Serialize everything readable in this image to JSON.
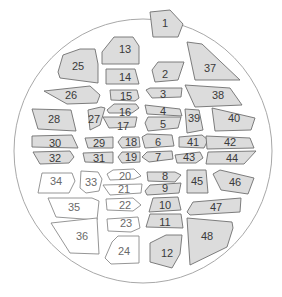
{
  "diagram": {
    "title": "",
    "colors": {
      "shaded_fill": "#dcdcdc",
      "unshaded_fill": "#ffffff",
      "stroke": "#6f6f6f",
      "outline": "#a8a8a8",
      "label": "#3a3a3a"
    },
    "outline": {
      "cx": 143,
      "cy": 151,
      "rx": 129,
      "ry": 132
    },
    "regions": [
      {
        "id": "1",
        "shaded": true,
        "points": "150,12 170,10 183,24 178,37 153,37",
        "lx": 165,
        "ly": 23
      },
      {
        "id": "2",
        "shaded": true,
        "points": "152,70 158,62 184,62 178,80 155,82",
        "lx": 165,
        "ly": 74
      },
      {
        "id": "3",
        "shaded": true,
        "points": "146,90 150,88 182,88 181,97 152,98",
        "lx": 163,
        "ly": 94
      },
      {
        "id": "4",
        "shaded": true,
        "points": "145,105 180,109 182,116 147,114",
        "lx": 163,
        "ly": 111
      },
      {
        "id": "5",
        "shaded": true,
        "points": "145,123 148,117 181,117 178,128 148,131",
        "lx": 163,
        "ly": 124
      },
      {
        "id": "6",
        "shaded": true,
        "points": "142,137 147,134 172,135 174,146 145,148",
        "lx": 158,
        "ly": 142
      },
      {
        "id": "7",
        "shaded": true,
        "points": "142,157 147,152 172,151 173,159 149,162",
        "lx": 158,
        "ly": 157
      },
      {
        "id": "8",
        "shaded": true,
        "points": "147,172 175,172 181,175 175,182 148,181",
        "lx": 165,
        "ly": 176
      },
      {
        "id": "9",
        "shaded": true,
        "points": "145,191 150,185 181,183 179,193 147,195",
        "lx": 165,
        "ly": 188
      },
      {
        "id": "10",
        "shaded": true,
        "points": "149,212 153,198 178,197 181,210",
        "lx": 165,
        "ly": 205
      },
      {
        "id": "11",
        "shaded": true,
        "points": "146,227 150,214 181,214 183,228",
        "lx": 165,
        "ly": 222
      },
      {
        "id": "12",
        "shaded": true,
        "points": "150,243 166,235 182,235 180,254 172,268 150,262",
        "lx": 167,
        "ly": 253
      },
      {
        "id": "13",
        "shaded": true,
        "points": "102,52 114,37 133,37 139,46 139,64 102,64",
        "lx": 125,
        "ly": 49
      },
      {
        "id": "14",
        "shaded": true,
        "points": "106,69 135,69 139,84 106,84",
        "lx": 125,
        "ly": 77
      },
      {
        "id": "15",
        "shaded": true,
        "points": "110,90 137,90 139,98 135,101 111,100",
        "lx": 126,
        "ly": 96
      },
      {
        "id": "16",
        "shaded": true,
        "points": "107,110 114,104 136,104 139,108 132,113 109,113",
        "lx": 125,
        "ly": 112
      },
      {
        "id": "17",
        "shaded": true,
        "points": "103,117 137,117 135,127 109,128",
        "lx": 123,
        "ly": 126
      },
      {
        "id": "18",
        "shaded": true,
        "points": "118,142 122,137 139,137 140,147 122,148",
        "lx": 131,
        "ly": 142
      },
      {
        "id": "19",
        "shaded": true,
        "points": "118,157 122,152 140,152 140,162 122,163",
        "lx": 131,
        "ly": 157
      },
      {
        "id": "20",
        "shaded": false,
        "points": "107,174 113,170 134,169 141,176 134,179 110,180",
        "lx": 125,
        "ly": 176
      },
      {
        "id": "21",
        "shaded": false,
        "points": "103,185 142,184 141,193 110,195",
        "lx": 124,
        "ly": 189
      },
      {
        "id": "22",
        "shaded": false,
        "points": "106,199 133,198 141,205 133,211 107,210",
        "lx": 125,
        "ly": 205
      },
      {
        "id": "23",
        "shaded": false,
        "points": "107,219 138,217 140,228 131,232 108,231",
        "lx": 126,
        "ly": 223
      },
      {
        "id": "24",
        "shaded": false,
        "points": "112,242 118,236 139,236 139,263 111,264 105,258",
        "lx": 124,
        "ly": 251
      },
      {
        "id": "25",
        "shaded": true,
        "points": "63,55 80,49 95,49 98,64 98,83 60,78 58,72",
        "lx": 78,
        "ly": 66
      },
      {
        "id": "26",
        "shaded": true,
        "points": "44,91 90,86 100,95 97,103 67,104",
        "lx": 71,
        "ly": 95
      },
      {
        "id": "27",
        "shaded": true,
        "points": "88,110 101,107 105,108 100,125 90,130",
        "lx": 94,
        "ly": 119
      },
      {
        "id": "28",
        "shaded": true,
        "points": "32,109 71,110 76,131 38,129",
        "lx": 54,
        "ly": 119
      },
      {
        "id": "29",
        "shaded": true,
        "points": "85,138 113,137 113,148 88,148",
        "lx": 99,
        "ly": 143
      },
      {
        "id": "30",
        "shaded": true,
        "points": "32,136 72,135 78,148 32,147",
        "lx": 55,
        "ly": 143
      },
      {
        "id": "31",
        "shaded": true,
        "points": "83,153 113,152 113,163 85,162",
        "lx": 99,
        "ly": 158
      },
      {
        "id": "32",
        "shaded": true,
        "points": "33,152 70,151 74,157 69,163 40,164",
        "lx": 55,
        "ly": 158
      },
      {
        "id": "33",
        "shaded": false,
        "points": "81,171 98,172 102,179 99,191 86,193 80,188",
        "lx": 91,
        "ly": 182
      },
      {
        "id": "34",
        "shaded": false,
        "points": "42,173 72,173 75,181 69,193 38,193",
        "lx": 56,
        "ly": 181
      },
      {
        "id": "35",
        "shaded": false,
        "points": "48,198 92,198 99,201 97,220 56,217",
        "lx": 74,
        "ly": 207
      },
      {
        "id": "36",
        "shaded": false,
        "points": "51,223 97,218 99,254 70,253",
        "lx": 82,
        "ly": 236
      },
      {
        "id": "37",
        "shaded": true,
        "points": "187,42 202,44 240,80 195,80",
        "lx": 210,
        "ly": 68
      },
      {
        "id": "38",
        "shaded": true,
        "points": "185,85 230,88 242,105 195,107",
        "lx": 218,
        "ly": 95
      },
      {
        "id": "39",
        "shaded": true,
        "points": "185,109 199,110 203,130 187,133",
        "lx": 194,
        "ly": 118
      },
      {
        "id": "40",
        "shaded": true,
        "points": "212,108 255,118 251,130 215,131",
        "lx": 234,
        "ly": 118
      },
      {
        "id": "41",
        "shaded": true,
        "points": "179,137 202,135 208,140 204,148 179,147",
        "lx": 193,
        "ly": 142
      },
      {
        "id": "42",
        "shaded": true,
        "points": "206,136 250,138 254,148 207,149",
        "lx": 230,
        "ly": 142
      },
      {
        "id": "43",
        "shaded": true,
        "points": "175,155 200,152 203,158 196,163 177,163",
        "lx": 189,
        "ly": 157
      },
      {
        "id": "44",
        "shaded": true,
        "points": "208,152 256,151 244,164 206,164",
        "lx": 232,
        "ly": 158
      },
      {
        "id": "45",
        "shaded": true,
        "points": "187,170 206,170 208,193 187,193",
        "lx": 197,
        "ly": 181
      },
      {
        "id": "46",
        "shaded": true,
        "points": "213,174 220,170 254,178 248,194 221,190",
        "lx": 235,
        "ly": 182
      },
      {
        "id": "47",
        "shaded": true,
        "points": "187,212 193,202 241,198 240,212 190,215",
        "lx": 216,
        "ly": 207
      },
      {
        "id": "48",
        "shaded": true,
        "points": "187,218 232,222 233,228 227,247 190,265",
        "lx": 207,
        "ly": 236
      }
    ]
  }
}
